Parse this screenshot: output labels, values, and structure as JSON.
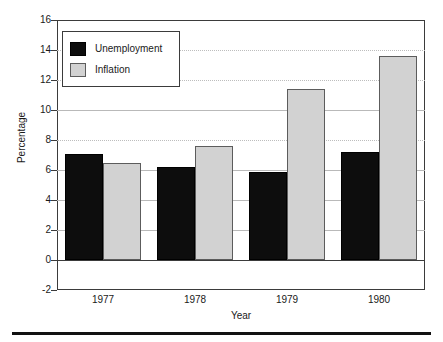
{
  "chart_data": {
    "type": "bar",
    "title": "",
    "xlabel": "Year",
    "ylabel": "Percentage",
    "categories": [
      "1977",
      "1978",
      "1979",
      "1980"
    ],
    "series": [
      {
        "name": "Unemployment",
        "color": "#0d0d0d",
        "values": [
          7.1,
          6.2,
          5.9,
          7.2
        ]
      },
      {
        "name": "Inflation",
        "color": "#d2d2d2",
        "values": [
          6.5,
          7.6,
          11.4,
          13.6
        ]
      }
    ],
    "ylim": [
      -2,
      16
    ],
    "yticks": [
      "16",
      "14",
      "12",
      "10",
      "8",
      "6",
      "4",
      "2",
      "0",
      "-2"
    ],
    "ytick_values": [
      16,
      14,
      12,
      10,
      8,
      6,
      4,
      2,
      0,
      -2
    ],
    "grid": true,
    "legend_position": "upper-left"
  },
  "legend": {
    "items": [
      {
        "label": "Unemployment"
      },
      {
        "label": "Inflation"
      }
    ]
  },
  "axes": {
    "y_title": "Percentage",
    "x_title": "Year"
  }
}
